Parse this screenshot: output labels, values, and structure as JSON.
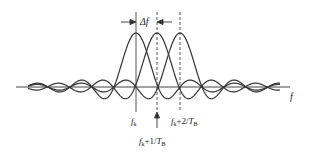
{
  "diagram": {
    "type": "ofdm-subcarrier-spectrum",
    "axis_label": "f",
    "delta_label": "Δf",
    "subcarriers": [
      {
        "name": "f_k",
        "center_x": 136,
        "line_style": "solid"
      },
      {
        "name": "f_k+1/T_B",
        "center_x": 157,
        "line_style": "dashed"
      },
      {
        "name": "f_k+2/T_B",
        "center_x": 180,
        "line_style": "dashed"
      }
    ],
    "labels": {
      "fk": {
        "base": "f",
        "sub": "k"
      },
      "fk1": {
        "base": "f",
        "sub": "k",
        "rest": "+1/",
        "T": "T",
        "Tsub": "B"
      },
      "fk2": {
        "base": "f",
        "sub": "k",
        "rest": "+2/",
        "T": "T",
        "Tsub": "B"
      }
    },
    "colors": {
      "stroke": "#333333",
      "background": "#ffffff"
    }
  }
}
